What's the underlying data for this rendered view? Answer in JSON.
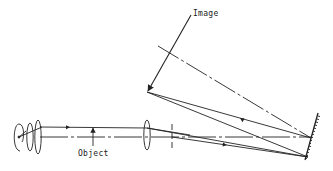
{
  "diagram": {
    "type": "optical-ray-diagram",
    "labels": {
      "image": "Image",
      "object": "Object"
    },
    "elements": [
      {
        "name": "light-source",
        "kind": "lamp filament"
      },
      {
        "name": "condenser-lens-1",
        "kind": "lens"
      },
      {
        "name": "condenser-lens-2",
        "kind": "lens"
      },
      {
        "name": "object-arrow",
        "kind": "object"
      },
      {
        "name": "objective-lens",
        "kind": "lens"
      },
      {
        "name": "aperture-stop",
        "kind": "stop"
      },
      {
        "name": "concave-mirror",
        "kind": "mirror"
      },
      {
        "name": "image-arrow",
        "kind": "image"
      }
    ],
    "colors": {
      "line": "#222222",
      "background": "#ffffff"
    }
  }
}
